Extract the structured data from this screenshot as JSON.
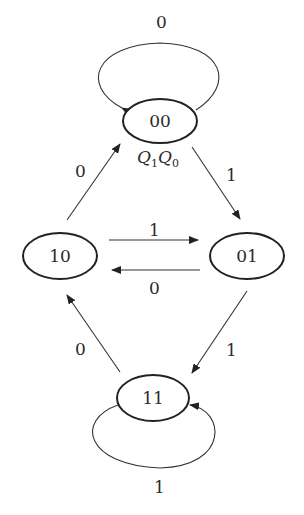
{
  "diagram": {
    "type": "state-transition",
    "state_variable_label": "Q1Q0",
    "states": [
      {
        "id": "s00",
        "label": "00"
      },
      {
        "id": "s01",
        "label": "01"
      },
      {
        "id": "s10",
        "label": "10"
      },
      {
        "id": "s11",
        "label": "11"
      }
    ],
    "transitions": [
      {
        "from": "00",
        "to": "00",
        "label": "0"
      },
      {
        "from": "00",
        "to": "01",
        "label": "1"
      },
      {
        "from": "10",
        "to": "01",
        "label": "1"
      },
      {
        "from": "01",
        "to": "10",
        "label": "0"
      },
      {
        "from": "01",
        "to": "11",
        "label": "1"
      },
      {
        "from": "11",
        "to": "10",
        "label": "0"
      },
      {
        "from": "10",
        "to": "00",
        "label": "0"
      },
      {
        "from": "11",
        "to": "11",
        "label": "1"
      }
    ]
  },
  "labels": {
    "q_main1": "Q",
    "q_sub1": "1",
    "q_main2": "Q",
    "q_sub2": "0"
  }
}
